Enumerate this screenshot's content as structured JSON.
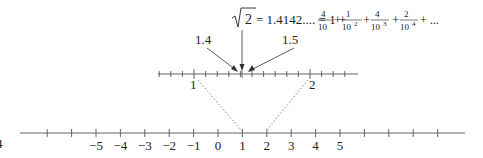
{
  "diagram": {
    "equation": {
      "sqrt_symbol": "√",
      "radicand": "2",
      "equals_value": "= 1.4142.... = 1 +",
      "terms": [
        {
          "num": "4",
          "den": "10",
          "exp": ""
        },
        {
          "num": "1",
          "den": "10",
          "exp": "2"
        },
        {
          "num": "4",
          "den": "10",
          "exp": "3"
        },
        {
          "num": "2",
          "den": "10",
          "exp": "4"
        }
      ],
      "tail": "+ ..."
    },
    "arrow_labels": {
      "left": "1.4",
      "right": "1.5"
    },
    "zoom_line": {
      "left_label": "1",
      "right_label": "2"
    },
    "main_line": {
      "tick_labels": [
        "−5",
        "−4",
        "−3",
        "−2",
        "−1",
        "0",
        "1",
        "2",
        "3",
        "4",
        "5"
      ]
    },
    "edge_label": "4",
    "colors": {
      "line": "#555555",
      "text": "#222222",
      "dotted": "#777777"
    }
  }
}
